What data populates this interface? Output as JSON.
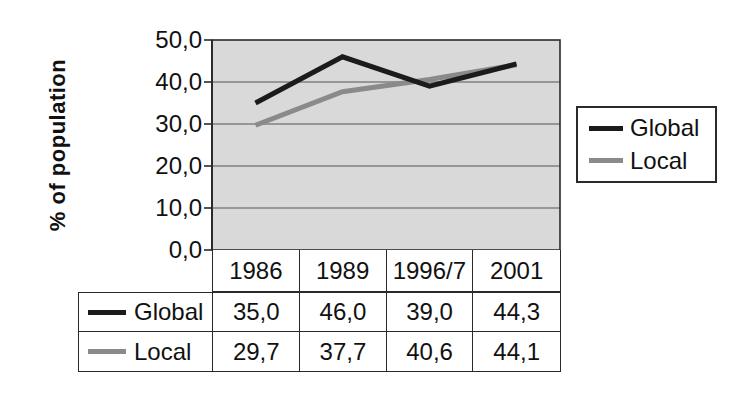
{
  "chart_data": {
    "type": "line",
    "title": "",
    "xlabel": "",
    "ylabel": "% of population",
    "categories": [
      "1986",
      "1989",
      "1996/7",
      "2001"
    ],
    "series": [
      {
        "name": "Global",
        "color": "#1b1b1b",
        "values": [
          35.0,
          46.0,
          39.0,
          44.3
        ],
        "display_values": [
          "35,0",
          "46,0",
          "39,0",
          "44,3"
        ]
      },
      {
        "name": "Local",
        "color": "#8a8a8a",
        "values": [
          29.7,
          37.7,
          40.6,
          44.1
        ],
        "display_values": [
          "29,7",
          "37,7",
          "40,6",
          "44,1"
        ]
      }
    ],
    "ylim": [
      0,
      50
    ],
    "ytick_step": 10,
    "ytick_labels": [
      "0,0",
      "10,0",
      "20,0",
      "30,0",
      "40,0",
      "50,0"
    ],
    "decimal_separator": ",",
    "grid": true,
    "legend_position": "right",
    "data_table_shown": true,
    "colors": {
      "plot_background": "#d9d9d9",
      "gridline": "#7f7f7f",
      "axis": "#2a2a2a",
      "text": "#111111",
      "figure_background": "#ffffff"
    }
  }
}
